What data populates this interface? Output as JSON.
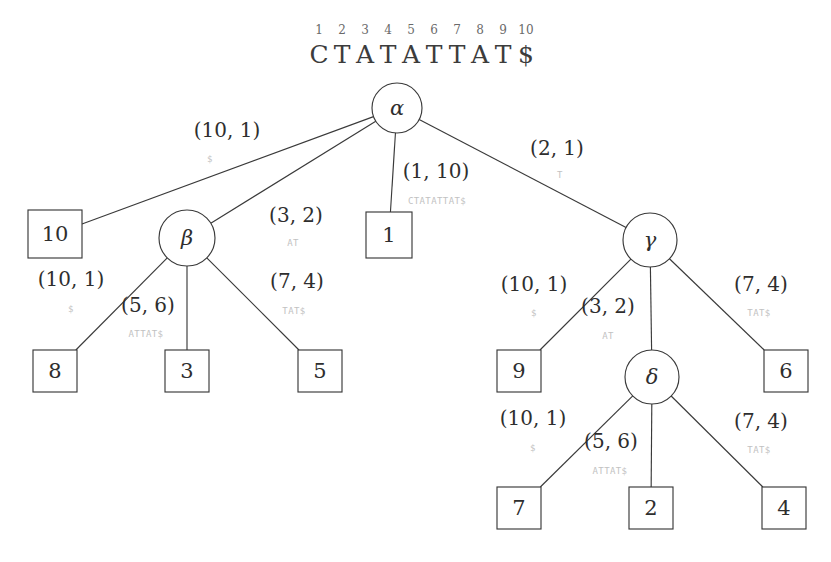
{
  "figure": {
    "kind": "suffix-tree-diagram",
    "title_string": "CTATATTAT$",
    "colors": {
      "stroke": "#3a3a3a",
      "text": "#2e2e2e",
      "faint_label": "#c2c2c2",
      "index_text": "#6a6a6a",
      "background": "#ffffff"
    }
  },
  "header": {
    "indices": [
      "1",
      "2",
      "3",
      "4",
      "5",
      "6",
      "7",
      "8",
      "9",
      "10"
    ],
    "characters": [
      "C",
      "T",
      "A",
      "T",
      "A",
      "T",
      "T",
      "A",
      "T",
      "$"
    ],
    "string": "CTATATTAT$"
  },
  "nodes": [
    {
      "id": "alpha",
      "label": "α",
      "x": 397,
      "y": 108,
      "r": 25,
      "kind": "internal"
    },
    {
      "id": "beta",
      "label": "β",
      "x": 187,
      "y": 238,
      "r": 28,
      "kind": "internal"
    },
    {
      "id": "gamma",
      "label": "γ",
      "x": 650,
      "y": 240,
      "r": 27,
      "kind": "internal"
    },
    {
      "id": "delta",
      "label": "δ",
      "x": 652,
      "y": 377,
      "r": 27,
      "kind": "internal"
    }
  ],
  "leaves": [
    {
      "id": "leaf-10",
      "label": "10",
      "cx": 55,
      "cy": 234,
      "w": 54,
      "h": 48
    },
    {
      "id": "leaf-1",
      "label": "1",
      "cx": 389,
      "cy": 235,
      "w": 46,
      "h": 46
    },
    {
      "id": "leaf-8",
      "label": "8",
      "cx": 55,
      "cy": 371,
      "w": 44,
      "h": 42
    },
    {
      "id": "leaf-3",
      "label": "3",
      "cx": 187,
      "cy": 371,
      "w": 44,
      "h": 42
    },
    {
      "id": "leaf-5",
      "label": "5",
      "cx": 320,
      "cy": 371,
      "w": 44,
      "h": 42
    },
    {
      "id": "leaf-9",
      "label": "9",
      "cx": 519,
      "cy": 371,
      "w": 44,
      "h": 42
    },
    {
      "id": "leaf-6",
      "label": "6",
      "cx": 786,
      "cy": 371,
      "w": 44,
      "h": 42
    },
    {
      "id": "leaf-7",
      "label": "7",
      "cx": 519,
      "cy": 508,
      "w": 44,
      "h": 42
    },
    {
      "id": "leaf-2",
      "label": "2",
      "cx": 651,
      "cy": 508,
      "w": 44,
      "h": 42
    },
    {
      "id": "leaf-4",
      "label": "4",
      "cx": 784,
      "cy": 508,
      "w": 44,
      "h": 42
    }
  ],
  "edges": [
    {
      "id": "edge-alpha-leaf10",
      "from": "alpha",
      "to": "leaf-10",
      "pair": "(10, 1)",
      "substring": "$",
      "pair_x": 227,
      "pair_y": 131,
      "sub_x": 210,
      "sub_y": 159
    },
    {
      "id": "edge-alpha-beta",
      "from": "alpha",
      "to": "beta",
      "pair": "(3, 2)",
      "substring": "AT",
      "pair_x": 296,
      "pair_y": 216,
      "sub_x": 293,
      "sub_y": 243
    },
    {
      "id": "edge-alpha-leaf1",
      "from": "alpha",
      "to": "leaf-1",
      "pair": "(1, 10)",
      "substring": "CTATATTAT$",
      "pair_x": 436,
      "pair_y": 172,
      "sub_x": 437,
      "sub_y": 201
    },
    {
      "id": "edge-alpha-gamma",
      "from": "alpha",
      "to": "gamma",
      "pair": "(2, 1)",
      "substring": "T",
      "pair_x": 557,
      "pair_y": 149,
      "sub_x": 560,
      "sub_y": 175
    },
    {
      "id": "edge-beta-leaf8",
      "from": "beta",
      "to": "leaf-8",
      "pair": "(10, 1)",
      "substring": "$",
      "pair_x": 71,
      "pair_y": 280,
      "sub_x": 71,
      "sub_y": 309
    },
    {
      "id": "edge-beta-leaf3",
      "from": "beta",
      "to": "leaf-3",
      "pair": "(5, 6)",
      "substring": "ATTAT$",
      "pair_x": 148,
      "pair_y": 306,
      "sub_x": 146,
      "sub_y": 334
    },
    {
      "id": "edge-beta-leaf5",
      "from": "beta",
      "to": "leaf-5",
      "pair": "(7, 4)",
      "substring": "TAT$",
      "pair_x": 297,
      "pair_y": 282,
      "sub_x": 294,
      "sub_y": 311
    },
    {
      "id": "edge-gamma-leaf9",
      "from": "gamma",
      "to": "leaf-9",
      "pair": "(10, 1)",
      "substring": "$",
      "pair_x": 534,
      "pair_y": 285,
      "sub_x": 534,
      "sub_y": 313
    },
    {
      "id": "edge-gamma-delta",
      "from": "gamma",
      "to": "delta",
      "pair": "(3, 2)",
      "substring": "AT",
      "pair_x": 608,
      "pair_y": 307,
      "sub_x": 608,
      "sub_y": 336
    },
    {
      "id": "edge-gamma-leaf6",
      "from": "gamma",
      "to": "leaf-6",
      "pair": "(7, 4)",
      "substring": "TAT$",
      "pair_x": 761,
      "pair_y": 285,
      "sub_x": 759,
      "sub_y": 313
    },
    {
      "id": "edge-delta-leaf7",
      "from": "delta",
      "to": "leaf-7",
      "pair": "(10, 1)",
      "substring": "$",
      "pair_x": 533,
      "pair_y": 419,
      "sub_x": 533,
      "sub_y": 448
    },
    {
      "id": "edge-delta-leaf2",
      "from": "delta",
      "to": "leaf-2",
      "pair": "(5, 6)",
      "substring": "ATTAT$",
      "pair_x": 611,
      "pair_y": 442,
      "sub_x": 610,
      "sub_y": 471
    },
    {
      "id": "edge-delta-leaf4",
      "from": "delta",
      "to": "leaf-4",
      "pair": "(7, 4)",
      "substring": "TAT$",
      "pair_x": 761,
      "pair_y": 422,
      "sub_x": 759,
      "sub_y": 450
    }
  ]
}
